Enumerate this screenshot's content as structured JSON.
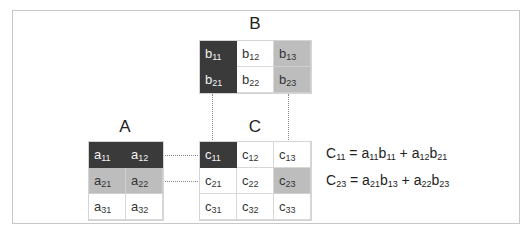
{
  "diagram": {
    "matrices": {
      "B": {
        "label": "B",
        "rows": [
          [
            {
              "base": "b",
              "sub": "11",
              "shade": "dark"
            },
            {
              "base": "b",
              "sub": "12",
              "shade": "none"
            },
            {
              "base": "b",
              "sub": "13",
              "shade": "mid"
            }
          ],
          [
            {
              "base": "b",
              "sub": "21",
              "shade": "dark"
            },
            {
              "base": "b",
              "sub": "22",
              "shade": "none"
            },
            {
              "base": "b",
              "sub": "23",
              "shade": "mid"
            }
          ]
        ]
      },
      "A": {
        "label": "A",
        "rows": [
          [
            {
              "base": "a",
              "sub": "11",
              "shade": "dark"
            },
            {
              "base": "a",
              "sub": "12",
              "shade": "dark"
            }
          ],
          [
            {
              "base": "a",
              "sub": "21",
              "shade": "mid"
            },
            {
              "base": "a",
              "sub": "22",
              "shade": "mid"
            }
          ],
          [
            {
              "base": "a",
              "sub": "31",
              "shade": "none"
            },
            {
              "base": "a",
              "sub": "32",
              "shade": "none"
            }
          ]
        ]
      },
      "C": {
        "label": "C",
        "rows": [
          [
            {
              "base": "c",
              "sub": "11",
              "shade": "dark"
            },
            {
              "base": "c",
              "sub": "12",
              "shade": "none"
            },
            {
              "base": "c",
              "sub": "13",
              "shade": "none"
            }
          ],
          [
            {
              "base": "c",
              "sub": "21",
              "shade": "none"
            },
            {
              "base": "c",
              "sub": "22",
              "shade": "none"
            },
            {
              "base": "c",
              "sub": "23",
              "shade": "mid"
            }
          ],
          [
            {
              "base": "c",
              "sub": "31",
              "shade": "none"
            },
            {
              "base": "c",
              "sub": "32",
              "shade": "none"
            },
            {
              "base": "c",
              "sub": "33",
              "shade": "none"
            }
          ]
        ]
      }
    },
    "equations": [
      {
        "lhs_base": "C",
        "lhs_sub": "11",
        "eq": " = ",
        "terms": [
          {
            "a": "a",
            "asub": "11",
            "b": "b",
            "bsub": "11"
          },
          {
            "a": "a",
            "asub": "12",
            "b": "b",
            "bsub": "21"
          }
        ]
      },
      {
        "lhs_base": "C",
        "lhs_sub": "23",
        "eq": " = ",
        "terms": [
          {
            "a": "a",
            "asub": "21",
            "b": "b",
            "bsub": "13"
          },
          {
            "a": "a",
            "asub": "22",
            "b": "b",
            "bsub": "23"
          }
        ]
      }
    ],
    "plus": " + ",
    "colors": {
      "dark": "#3a3a3a",
      "mid": "#bdbdbd",
      "light": "#ffffff",
      "guide": "#888888"
    }
  }
}
